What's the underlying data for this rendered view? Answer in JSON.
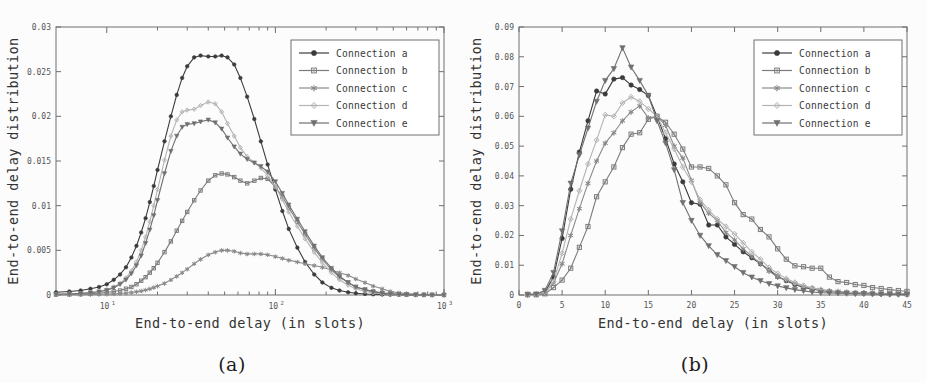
{
  "figure": {
    "panels": [
      {
        "id": "a",
        "caption": "(a)",
        "xlabel": "End-to-end delay (in slots)",
        "ylabel": "End-to-end delay distribution",
        "legend_position": "top-right"
      },
      {
        "id": "b",
        "caption": "(b)",
        "xlabel": "End-to-end delay (in slots)",
        "ylabel": "End-to-end delay distribution",
        "legend_position": "top-right"
      }
    ],
    "legend_labels": [
      "Connection a",
      "Connection b",
      "Connection c",
      "Connection d",
      "Connection e"
    ],
    "series_colors": [
      "#3b3b3b",
      "#7c7c7c",
      "#8a8a8a",
      "#b4b4b4",
      "#707070"
    ],
    "series_markers": [
      "circle",
      "square",
      "star",
      "diamond",
      "triangle-down"
    ]
  },
  "chart_data": [
    {
      "type": "line",
      "panel": "a",
      "title": "",
      "xlabel": "End-to-end delay (in slots)",
      "ylabel": "End-to-end delay distribution",
      "xscale": "log",
      "xlim": [
        5,
        1000
      ],
      "ylim": [
        0,
        0.03
      ],
      "xticks": [
        10,
        100,
        1000
      ],
      "xtick_labels": [
        "10^1",
        "10^2",
        "10^3"
      ],
      "yticks": [
        0,
        0.005,
        0.01,
        0.015,
        0.02,
        0.025,
        0.03
      ],
      "ytick_labels": [
        "0",
        "0.005",
        "0.01",
        "0.015",
        "0.02",
        "0.025",
        "0.03"
      ],
      "grid": false,
      "legend": [
        "Connection a",
        "Connection b",
        "Connection c",
        "Connection d",
        "Connection e"
      ],
      "x": [
        5,
        6,
        7,
        8,
        9,
        10,
        11,
        12,
        13,
        14,
        15,
        16,
        17,
        18,
        19,
        20,
        22,
        24,
        26,
        28,
        30,
        33,
        36,
        40,
        44,
        48,
        52,
        57,
        62,
        68,
        75,
        82,
        90,
        100,
        110,
        120,
        135,
        150,
        170,
        190,
        215,
        240,
        270,
        300,
        340,
        380,
        430,
        480,
        540,
        600,
        680,
        760,
        850,
        1000
      ],
      "series": [
        {
          "name": "Connection a",
          "marker": "circle",
          "values": [
            0.0003,
            0.0004,
            0.0005,
            0.0007,
            0.0009,
            0.0012,
            0.0017,
            0.0023,
            0.0031,
            0.0042,
            0.0055,
            0.007,
            0.0086,
            0.0104,
            0.0122,
            0.014,
            0.0172,
            0.02,
            0.0224,
            0.0243,
            0.0256,
            0.0266,
            0.0268,
            0.0267,
            0.0267,
            0.0268,
            0.0266,
            0.0258,
            0.0243,
            0.0222,
            0.0197,
            0.0172,
            0.0146,
            0.0118,
            0.0094,
            0.0074,
            0.0053,
            0.0037,
            0.0023,
            0.0014,
            0.0008,
            0.0005,
            0.0003,
            0.0002,
            0.00012,
            8e-05,
            5e-05,
            3e-05,
            2e-05,
            1e-05,
            1e-05,
            5e-06,
            3e-06,
            2e-06
          ]
        },
        {
          "name": "Connection b",
          "marker": "square",
          "values": [
            5e-05,
            7e-05,
            0.0001,
            0.00015,
            0.0002,
            0.0003,
            0.0004,
            0.0005,
            0.0007,
            0.0009,
            0.0012,
            0.0016,
            0.002,
            0.0025,
            0.003,
            0.0036,
            0.0048,
            0.006,
            0.0072,
            0.0083,
            0.0093,
            0.0106,
            0.0117,
            0.0128,
            0.0134,
            0.0136,
            0.0135,
            0.0132,
            0.0128,
            0.0125,
            0.0128,
            0.0131,
            0.013,
            0.0121,
            0.011,
            0.0098,
            0.0082,
            0.0068,
            0.0052,
            0.004,
            0.0028,
            0.002,
            0.0014,
            0.0009,
            0.0006,
            0.0004,
            0.00025,
            0.00015,
            9e-05,
            5e-05,
            3e-05,
            2e-05,
            1e-05,
            5e-06
          ]
        },
        {
          "name": "Connection c",
          "marker": "star",
          "values": [
            2e-05,
            3e-05,
            4e-05,
            6e-05,
            8e-05,
            0.0001,
            0.00013,
            0.00017,
            0.00022,
            0.00028,
            0.00036,
            0.00045,
            0.00056,
            0.00069,
            0.00084,
            0.001,
            0.0013,
            0.0017,
            0.0021,
            0.0025,
            0.0029,
            0.0035,
            0.004,
            0.0045,
            0.0048,
            0.005,
            0.005,
            0.0049,
            0.0047,
            0.0046,
            0.0046,
            0.0046,
            0.0045,
            0.0043,
            0.0041,
            0.0039,
            0.0037,
            0.0035,
            0.0033,
            0.0031,
            0.0028,
            0.0025,
            0.0022,
            0.0018,
            0.0014,
            0.001,
            0.0007,
            0.0004,
            0.00025,
            0.00015,
            8e-05,
            4e-05,
            2e-05,
            1e-05
          ]
        },
        {
          "name": "Connection d",
          "marker": "diamond",
          "values": [
            0.0001,
            0.00015,
            0.0002,
            0.0003,
            0.0004,
            0.0006,
            0.0009,
            0.0013,
            0.0019,
            0.0027,
            0.0037,
            0.005,
            0.0065,
            0.0082,
            0.01,
            0.0118,
            0.0151,
            0.0178,
            0.0196,
            0.0205,
            0.0207,
            0.0208,
            0.0212,
            0.0216,
            0.0214,
            0.0205,
            0.0192,
            0.0178,
            0.0165,
            0.0155,
            0.0148,
            0.0142,
            0.0134,
            0.0121,
            0.0107,
            0.0093,
            0.0077,
            0.0063,
            0.0048,
            0.0036,
            0.0025,
            0.0017,
            0.0011,
            0.0007,
            0.0004,
            0.00025,
            0.00015,
            9e-05,
            5e-05,
            3e-05,
            2e-05,
            1e-05,
            6e-06,
            3e-06
          ]
        },
        {
          "name": "Connection e",
          "marker": "triangle-down",
          "values": [
            8e-05,
            0.00012,
            0.00018,
            0.00026,
            0.00037,
            0.00053,
            0.0008,
            0.0012,
            0.0017,
            0.0024,
            0.0033,
            0.0044,
            0.0058,
            0.0073,
            0.0089,
            0.0106,
            0.0136,
            0.0161,
            0.0178,
            0.0188,
            0.0191,
            0.0192,
            0.0194,
            0.0196,
            0.0193,
            0.0186,
            0.0176,
            0.0166,
            0.0158,
            0.0152,
            0.0148,
            0.0144,
            0.0138,
            0.0127,
            0.0114,
            0.0101,
            0.0085,
            0.0071,
            0.0055,
            0.0042,
            0.003,
            0.0021,
            0.0014,
            0.0009,
            0.0006,
            0.00035,
            0.0002,
            0.00012,
            7e-05,
            4e-05,
            2e-05,
            1e-05,
            7e-06,
            4e-06
          ]
        }
      ]
    },
    {
      "type": "line",
      "panel": "b",
      "title": "",
      "xlabel": "End-to-end delay (in slots)",
      "ylabel": "End-to-end delay distribution",
      "xscale": "linear",
      "xlim": [
        0,
        45
      ],
      "ylim": [
        0,
        0.09
      ],
      "xticks": [
        0,
        5,
        10,
        15,
        20,
        25,
        30,
        35,
        40,
        45
      ],
      "xtick_labels": [
        "0",
        "5",
        "10",
        "15",
        "20",
        "25",
        "30",
        "35",
        "40",
        "45"
      ],
      "yticks": [
        0,
        0.01,
        0.02,
        0.03,
        0.04,
        0.05,
        0.06,
        0.07,
        0.08,
        0.09
      ],
      "ytick_labels": [
        "0",
        "0.01",
        "0.02",
        "0.03",
        "0.04",
        "0.05",
        "0.06",
        "0.07",
        "0.08",
        "0.09"
      ],
      "grid": false,
      "legend": [
        "Connection a",
        "Connection b",
        "Connection c",
        "Connection d",
        "Connection e"
      ],
      "x": [
        1,
        2,
        3,
        4,
        5,
        6,
        7,
        8,
        9,
        10,
        11,
        12,
        13,
        14,
        15,
        16,
        17,
        18,
        19,
        20,
        21,
        22,
        23,
        24,
        25,
        26,
        27,
        28,
        29,
        30,
        31,
        32,
        33,
        34,
        35,
        36,
        37,
        38,
        39,
        40,
        41,
        42,
        43,
        44,
        45
      ],
      "series": [
        {
          "name": "Connection a",
          "marker": "circle",
          "values": [
            0.0002,
            0.0002,
            0.0008,
            0.006,
            0.019,
            0.0355,
            0.048,
            0.0585,
            0.0685,
            0.0675,
            0.0725,
            0.073,
            0.0705,
            0.069,
            0.067,
            0.06,
            0.0525,
            0.044,
            0.038,
            0.031,
            0.0305,
            0.0235,
            0.0235,
            0.0195,
            0.017,
            0.0145,
            0.0125,
            0.0105,
            0.0085,
            0.0062,
            0.0048,
            0.0035,
            0.0025,
            0.002,
            0.0015,
            0.0012,
            0.001,
            0.0008,
            0.0007,
            0.0006,
            0.0005,
            0.0004,
            0.0003,
            0.0003,
            0.0002
          ]
        },
        {
          "name": "Connection b",
          "marker": "square",
          "values": [
            0.0001,
            0.0001,
            0.0004,
            0.0025,
            0.005,
            0.009,
            0.016,
            0.023,
            0.033,
            0.038,
            0.043,
            0.0495,
            0.054,
            0.0545,
            0.059,
            0.06,
            0.058,
            0.054,
            0.049,
            0.043,
            0.043,
            0.0425,
            0.04,
            0.037,
            0.031,
            0.027,
            0.0255,
            0.022,
            0.0195,
            0.0155,
            0.012,
            0.0098,
            0.0095,
            0.009,
            0.009,
            0.006,
            0.0045,
            0.0042,
            0.0035,
            0.0032,
            0.0025,
            0.0022,
            0.0018,
            0.0015,
            0.0012
          ]
        },
        {
          "name": "Connection c",
          "marker": "star",
          "values": [
            0.0001,
            0.0002,
            0.0008,
            0.004,
            0.0105,
            0.02,
            0.029,
            0.0375,
            0.045,
            0.051,
            0.0545,
            0.0585,
            0.0615,
            0.0635,
            0.0595,
            0.06,
            0.057,
            0.05,
            0.046,
            0.0385,
            0.031,
            0.0275,
            0.025,
            0.021,
            0.0185,
            0.0155,
            0.013,
            0.0105,
            0.008,
            0.006,
            0.005,
            0.0038,
            0.0028,
            0.0022,
            0.0018,
            0.0014,
            0.0012,
            0.001,
            0.0008,
            0.0007,
            0.0006,
            0.0005,
            0.0004,
            0.0003,
            0.0002
          ]
        },
        {
          "name": "Connection d",
          "marker": "diamond",
          "values": [
            0.0001,
            0.0002,
            0.001,
            0.0045,
            0.014,
            0.0255,
            0.035,
            0.044,
            0.052,
            0.0605,
            0.06,
            0.0645,
            0.0665,
            0.065,
            0.0625,
            0.06,
            0.0545,
            0.049,
            0.043,
            0.038,
            0.032,
            0.0285,
            0.0255,
            0.023,
            0.0205,
            0.0175,
            0.0145,
            0.012,
            0.0092,
            0.0072,
            0.0055,
            0.0042,
            0.0032,
            0.0024,
            0.0018,
            0.0014,
            0.0011,
            0.0009,
            0.0007,
            0.0006,
            0.0005,
            0.0004,
            0.0003,
            0.0003,
            0.0002
          ]
        },
        {
          "name": "Connection e",
          "marker": "triangle-down",
          "values": [
            0.0002,
            0.0003,
            0.0015,
            0.0075,
            0.0215,
            0.0375,
            0.047,
            0.056,
            0.065,
            0.072,
            0.076,
            0.083,
            0.0765,
            0.072,
            0.067,
            0.0585,
            0.051,
            0.042,
            0.031,
            0.025,
            0.02,
            0.0165,
            0.0135,
            0.0115,
            0.0095,
            0.0075,
            0.006,
            0.0048,
            0.0038,
            0.003,
            0.0024,
            0.0018,
            0.0014,
            0.001,
            0.0008,
            0.0007,
            0.0006,
            0.0005,
            0.0004,
            0.0004,
            0.0003,
            0.0003,
            0.0002,
            0.0002,
            0.0002
          ]
        }
      ]
    }
  ]
}
